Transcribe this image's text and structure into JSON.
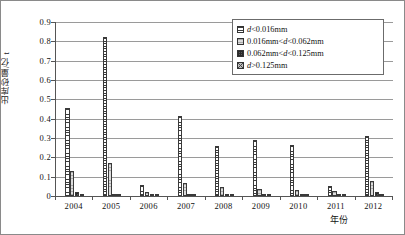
{
  "chart_data": {
    "type": "bar",
    "title": "",
    "xlabel": "年份",
    "ylabel": "出库砂量/亿 t",
    "categories": [
      "2004",
      "2005",
      "2006",
      "2007",
      "2008",
      "2009",
      "2010",
      "2011",
      "2012"
    ],
    "ylim": [
      0,
      0.9
    ],
    "ytick_labels": [
      "0",
      "0.1",
      "0.2",
      "0.3",
      "0.4",
      "0.5",
      "0.6",
      "0.7",
      "0.8",
      "0.9"
    ],
    "ytick_values": [
      0,
      0.1,
      0.2,
      0.3,
      0.4,
      0.5,
      0.6,
      0.7,
      0.8,
      0.9
    ],
    "grid": true,
    "legend_position": "top-right",
    "series": [
      {
        "name": "d<0.016mm",
        "pattern": "horizontal-hatch",
        "values": [
          0.455,
          0.82,
          0.055,
          0.415,
          0.26,
          0.29,
          0.265,
          0.05,
          0.31
        ]
      },
      {
        "name": "0.016mm<d<0.062mm",
        "pattern": "light-grey",
        "values": [
          0.13,
          0.17,
          0.02,
          0.065,
          0.045,
          0.035,
          0.03,
          0.025,
          0.08
        ]
      },
      {
        "name": "0.062mm<d<0.125mm",
        "pattern": "dark-checker",
        "values": [
          0.02,
          0.012,
          0.004,
          0.008,
          0.008,
          0.006,
          0.005,
          0.004,
          0.02
        ]
      },
      {
        "name": "d>0.125mm",
        "pattern": "cross-hatch",
        "values": [
          0.008,
          0.005,
          0.002,
          0.003,
          0.003,
          0.002,
          0.002,
          0.002,
          0.006
        ]
      }
    ]
  },
  "legend": {
    "items": [
      {
        "prefix": "",
        "var": "d",
        "rest": "<0.016mm"
      },
      {
        "prefix": "0.016mm<",
        "var": "d",
        "rest": "<0.062mm"
      },
      {
        "prefix": "0.062mm<",
        "var": "d",
        "rest": "<0.125mm"
      },
      {
        "prefix": "",
        "var": "d",
        "rest": ">0.125mm"
      }
    ]
  },
  "axes": {
    "y_title": "出库砂量/亿 t",
    "x_title": "年份"
  }
}
